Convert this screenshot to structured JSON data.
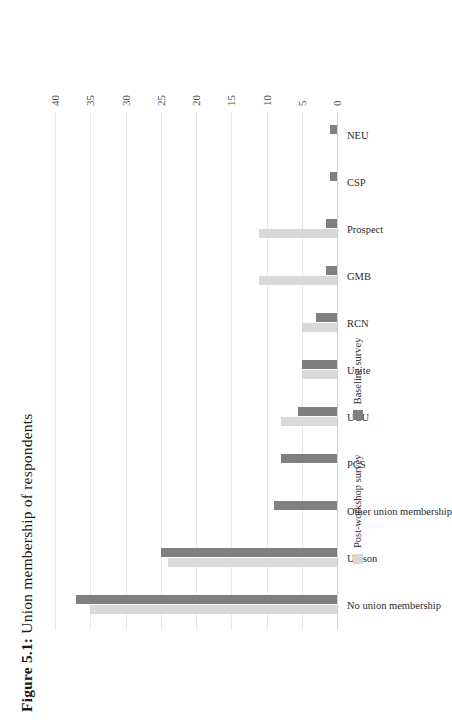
{
  "figure": {
    "label": "Figure 5.1:",
    "caption": " Union membership of respondents",
    "full_title": "Figure 5.1: Union membership of respondents"
  },
  "legend": {
    "position": "bottom",
    "items": [
      {
        "label": "Post-workshop survey",
        "color": "#d9d9d9"
      },
      {
        "label": "Baseline survey",
        "color": "#7f7f7f"
      }
    ]
  },
  "axis": {
    "ticks": [
      "0",
      "5",
      "10",
      "15",
      "20",
      "25",
      "30",
      "35",
      "40"
    ]
  },
  "chart_data": {
    "type": "bar",
    "title": "Figure 5.1: Union membership of respondents",
    "xlabel": "",
    "ylabel": "",
    "ylim": [
      0,
      40
    ],
    "yticks": [
      0,
      5,
      10,
      15,
      20,
      25,
      30,
      35,
      40
    ],
    "grid": true,
    "legend_position": "bottom",
    "orientation": "vertical-bars-rotated-page",
    "categories": [
      "No union membership",
      "Unison",
      "Other union membership",
      "PCS",
      "UCU",
      "Unite",
      "RCN",
      "GMB",
      "Prospect",
      "CSP",
      "NEU"
    ],
    "series": [
      {
        "name": "Baseline survey",
        "color": "#7f7f7f",
        "values": [
          37,
          25,
          9,
          8,
          5.5,
          5,
          3,
          1.5,
          1.5,
          1,
          1
        ]
      },
      {
        "name": "Post-workshop survey",
        "color": "#d9d9d9",
        "values": [
          35,
          24,
          0,
          0,
          8,
          5,
          5,
          11,
          11,
          0,
          0
        ]
      }
    ]
  }
}
